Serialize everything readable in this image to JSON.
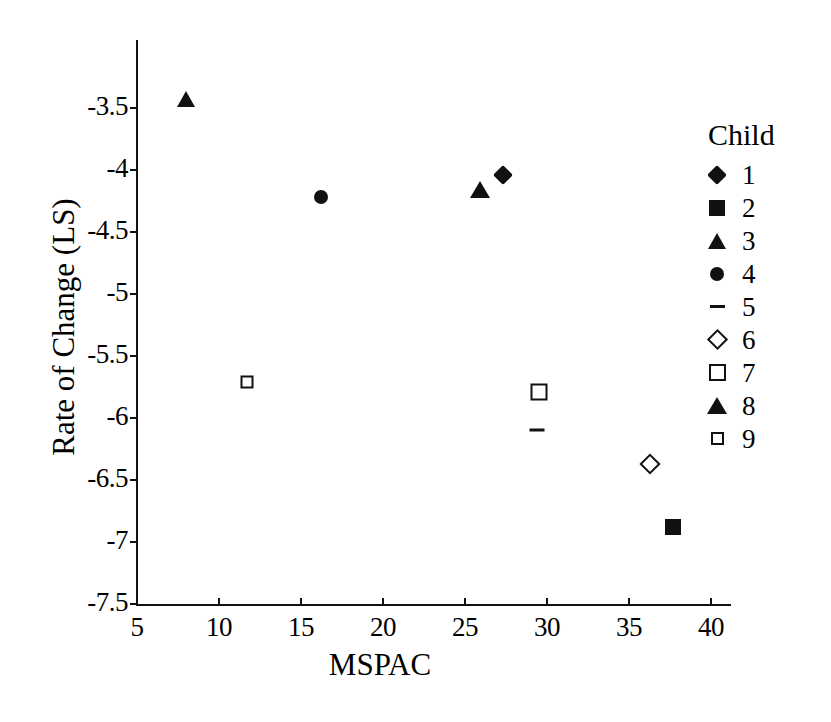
{
  "chart_data": {
    "type": "scatter",
    "title": "",
    "xlabel": "MSPAC",
    "ylabel": "Rate of Change (LS)",
    "xlim": [
      5,
      41.5
    ],
    "ylim": [
      -7.5,
      -3.2
    ],
    "xticks": [
      5,
      10,
      15,
      20,
      25,
      30,
      35,
      40
    ],
    "xtick_labels": [
      "5",
      "10",
      "15",
      "20",
      "25",
      "30",
      "35",
      "40"
    ],
    "yticks": [
      -3.5,
      -4,
      -4.5,
      -5,
      -5.5,
      -6,
      -6.5,
      -7,
      -7.5
    ],
    "ytick_labels": [
      "-3.5",
      "-4",
      "-4.5",
      "-5",
      "-5.5",
      "-6",
      "-6.5",
      "-7",
      "-7.5"
    ],
    "grid": false,
    "legend_position": "right",
    "legend_title": "Child",
    "series": [
      {
        "name": "1",
        "marker": "filled-diamond",
        "x": [
          27.3
        ],
        "y": [
          -4.04
        ]
      },
      {
        "name": "2",
        "marker": "filled-square",
        "x": [
          37.7
        ],
        "y": [
          -6.88
        ]
      },
      {
        "name": "3",
        "marker": "filled-triangle",
        "x": [
          8.0
        ],
        "y": [
          -3.43
        ]
      },
      {
        "name": "4",
        "marker": "filled-circle",
        "x": [
          16.2
        ],
        "y": [
          -4.22
        ]
      },
      {
        "name": "5",
        "marker": "dash",
        "x": [
          29.4
        ],
        "y": [
          -6.1
        ]
      },
      {
        "name": "6",
        "marker": "open-diamond",
        "x": [
          36.3
        ],
        "y": [
          -6.37
        ]
      },
      {
        "name": "7",
        "marker": "open-square",
        "x": [
          29.5
        ],
        "y": [
          -5.79
        ]
      },
      {
        "name": "8",
        "marker": "open-triangle",
        "x": [
          25.3
        ],
        "y": [
          -3.95
        ]
      },
      {
        "name": "9",
        "marker": "open-square-small",
        "x": [
          11.7
        ],
        "y": [
          -5.71
        ]
      }
    ]
  },
  "legend": {
    "title": "Child",
    "items": [
      {
        "label": "1",
        "marker": "filled-diamond"
      },
      {
        "label": "2",
        "marker": "filled-square"
      },
      {
        "label": "3",
        "marker": "filled-triangle"
      },
      {
        "label": "4",
        "marker": "filled-circle"
      },
      {
        "label": "5",
        "marker": "dash"
      },
      {
        "label": "6",
        "marker": "open-diamond"
      },
      {
        "label": "7",
        "marker": "open-square"
      },
      {
        "label": "8",
        "marker": "open-triangle"
      },
      {
        "label": "9",
        "marker": "open-square-small"
      }
    ]
  },
  "colors": {
    "ink": "#111111",
    "background": "#ffffff"
  }
}
